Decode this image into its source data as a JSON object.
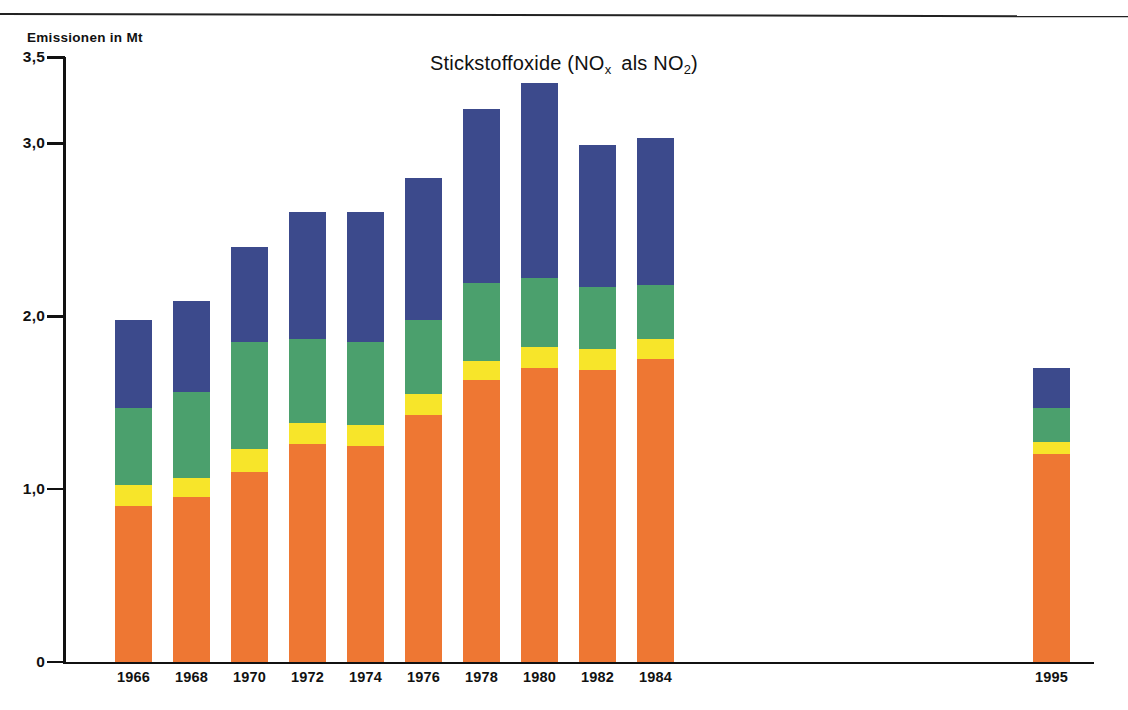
{
  "figure": {
    "title_main": "Stickstoffoxide (NO",
    "title_sub1": "x",
    "title_mid": "als NO",
    "title_sub2": "2",
    "title_close": ")",
    "y_axis_unit": "Emissionen in Mt"
  },
  "chart_data": {
    "type": "bar",
    "stacked": true,
    "xlabel": "",
    "ylabel": "Emissionen in Mt",
    "ylim": [
      0,
      3.5
    ],
    "yticks": [
      "0",
      "1,0",
      "2,0",
      "3,0",
      "3,5"
    ],
    "ytick_values": [
      0,
      1.0,
      2.0,
      3.0,
      3.5
    ],
    "grid": false,
    "legend": "none",
    "categories": [
      "1966",
      "1968",
      "1970",
      "1972",
      "1974",
      "1976",
      "1978",
      "1980",
      "1982",
      "1984",
      "1995"
    ],
    "colors": {
      "orange": "#ee7733",
      "yellow": "#f7e52a",
      "green": "#4ba06d",
      "blue": "#3c4a8c"
    },
    "series": [
      {
        "name": "orange",
        "color": "#ee7733",
        "values": [
          0.9,
          0.95,
          1.1,
          1.26,
          1.25,
          1.43,
          1.63,
          1.7,
          1.69,
          1.75,
          1.2
        ]
      },
      {
        "name": "yellow",
        "color": "#f7e52a",
        "values": [
          0.12,
          0.11,
          0.13,
          0.12,
          0.12,
          0.12,
          0.11,
          0.12,
          0.12,
          0.12,
          0.07
        ]
      },
      {
        "name": "green",
        "color": "#4ba06d",
        "values": [
          0.45,
          0.5,
          0.62,
          0.49,
          0.48,
          0.43,
          0.45,
          0.4,
          0.36,
          0.31,
          0.2
        ]
      },
      {
        "name": "blue",
        "color": "#3c4a8c",
        "values": [
          0.51,
          0.53,
          0.55,
          0.73,
          0.75,
          0.82,
          1.01,
          1.13,
          0.82,
          0.85,
          0.23
        ]
      }
    ],
    "totals": [
      1.98,
      2.09,
      2.4,
      2.6,
      2.6,
      2.8,
      3.2,
      3.35,
      2.99,
      3.03,
      1.7
    ],
    "x_positions_px": [
      115,
      173,
      231,
      289,
      347,
      405,
      463,
      521,
      579,
      637,
      1033
    ]
  }
}
